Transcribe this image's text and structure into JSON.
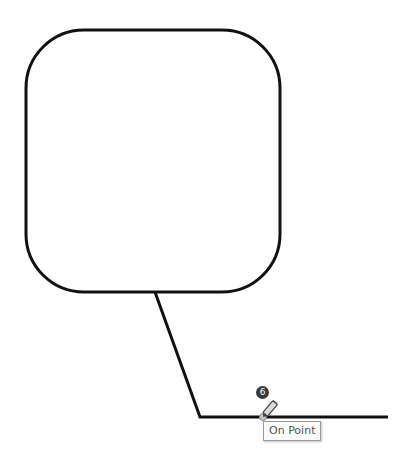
{
  "drawing": {
    "shapes": [
      {
        "type": "rounded-rectangle",
        "x": 26,
        "y": 30,
        "width": 254,
        "height": 262,
        "radius": 58,
        "stroke": "#111111",
        "stroke_width": 3
      },
      {
        "type": "polyline",
        "points": [
          [
            155,
            292
          ],
          [
            200,
            417
          ],
          [
            388,
            417
          ]
        ],
        "stroke": "#111111",
        "stroke_width": 3
      }
    ]
  },
  "cursor": {
    "step_badge": "6",
    "snap_tooltip": "On Point",
    "icon": "pen-cursor-icon"
  },
  "colors": {
    "stroke": "#111111",
    "badge_bg": "#3a3a3a",
    "tooltip_border": "#9a9a9a",
    "tooltip_text": "#555555"
  }
}
